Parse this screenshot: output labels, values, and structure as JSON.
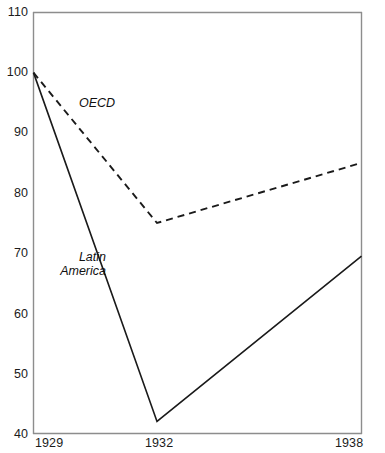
{
  "chart_data": {
    "type": "line",
    "title": "",
    "subtitle": "",
    "xlabel": "",
    "ylabel": "",
    "x": [
      1929,
      1932,
      1938
    ],
    "xtick_labels": [
      "1929",
      "1932",
      "1938"
    ],
    "ytick_labels": [
      "110",
      "100",
      "90",
      "80",
      "70",
      "60",
      "50",
      "40"
    ],
    "ytick_values": [
      110,
      100,
      90,
      80,
      70,
      60,
      50,
      40
    ],
    "ylim": [
      40,
      110
    ],
    "xlim": [
      1929,
      1938
    ],
    "grid": false,
    "legend_position": "inline-annotation",
    "series": [
      {
        "name": "Latin America",
        "label": "Latin America",
        "style": "solid",
        "color": "#1a1a1a",
        "values": [
          100,
          42,
          69.5
        ]
      },
      {
        "name": "OECD",
        "label": "OECD",
        "style": "dashed",
        "color": "#1a1a1a",
        "values": [
          100,
          75,
          85
        ]
      }
    ],
    "annotations": [
      {
        "text": "OECD",
        "x": 1931.1,
        "y": 94.5
      },
      {
        "text": "Latin America",
        "x": 1930.2,
        "y": 68.0
      }
    ]
  },
  "axes": {
    "frame_color": "#8d8d8d",
    "line_color": "#1a1a1a"
  },
  "caption": {
    "cut_off_text": ""
  }
}
